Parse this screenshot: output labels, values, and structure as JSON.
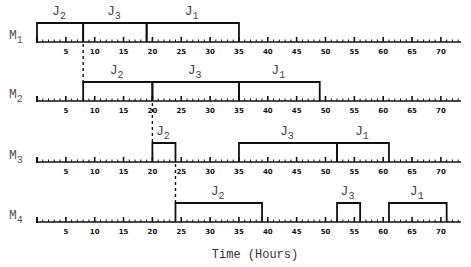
{
  "chart_data": {
    "type": "gantt",
    "xlabel": "Time (Hours)",
    "x_range": [
      0,
      73
    ],
    "tick_labels": [
      5,
      10,
      15,
      20,
      25,
      30,
      35,
      40,
      45,
      50,
      55,
      60,
      65,
      70
    ],
    "machines": [
      {
        "name": "M",
        "sub": "1",
        "jobs": [
          {
            "name": "J",
            "sub": "2",
            "start": 0,
            "end": 8
          },
          {
            "name": "J",
            "sub": "3",
            "start": 8,
            "end": 19
          },
          {
            "name": "J",
            "sub": "1",
            "start": 19,
            "end": 35
          }
        ]
      },
      {
        "name": "M",
        "sub": "2",
        "jobs": [
          {
            "name": "J",
            "sub": "2",
            "start": 8,
            "end": 20
          },
          {
            "name": "J",
            "sub": "3",
            "start": 20,
            "end": 35
          },
          {
            "name": "J",
            "sub": "1",
            "start": 35,
            "end": 49
          }
        ]
      },
      {
        "name": "M",
        "sub": "3",
        "jobs": [
          {
            "name": "J",
            "sub": "2",
            "start": 20,
            "end": 24
          },
          {
            "name": "J",
            "sub": "3",
            "start": 35,
            "end": 52
          },
          {
            "name": "J",
            "sub": "1",
            "start": 52,
            "end": 61
          }
        ]
      },
      {
        "name": "M",
        "sub": "4",
        "jobs": [
          {
            "name": "J",
            "sub": "2",
            "start": 24,
            "end": 39
          },
          {
            "name": "J",
            "sub": "3",
            "start": 52,
            "end": 56
          },
          {
            "name": "J",
            "sub": "1",
            "start": 61,
            "end": 71
          }
        ]
      }
    ],
    "dashed_links": [
      {
        "time": 8,
        "from_machine": 1,
        "to_machine": 2
      },
      {
        "time": 20,
        "from_machine": 2,
        "to_machine": 3
      },
      {
        "time": 24,
        "from_machine": 3,
        "to_machine": 4
      }
    ]
  }
}
